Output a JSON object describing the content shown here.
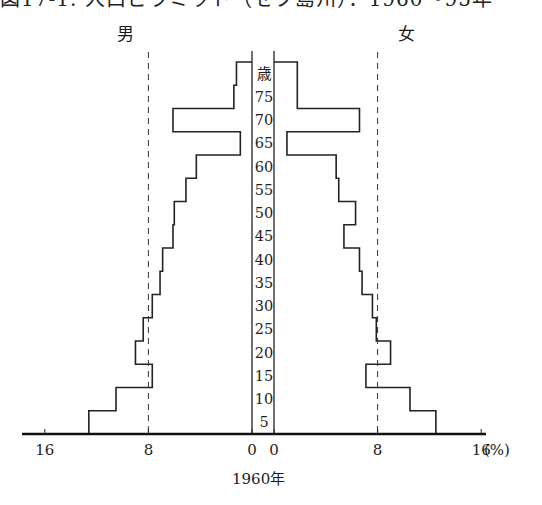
{
  "header": {
    "title": "図17-1. 人口ピラミッド（セブ島州）：1960～95年"
  },
  "labels": {
    "male": "男",
    "female": "女",
    "age_unit": "歳",
    "year": "1960年",
    "percent_unit": "(%)"
  },
  "chart_data": {
    "type": "bar",
    "subtype": "population-pyramid",
    "xlabel": "(%)",
    "ylabel": "歳",
    "categories": [
      "0-4",
      "5-9",
      "10-14",
      "15-19",
      "20-24",
      "25-29",
      "30-34",
      "35-39",
      "40-44",
      "45-49",
      "50-54",
      "55-59",
      "60-64",
      "65-69",
      "70-74",
      "75+"
    ],
    "age_tick_labels": [
      "5",
      "10",
      "15",
      "20",
      "25",
      "30",
      "35",
      "40",
      "45",
      "50",
      "55",
      "60",
      "65",
      "70",
      "75",
      "歳"
    ],
    "series": [
      {
        "name": "男",
        "side": "left",
        "values": [
          12.6,
          10.5,
          7.7,
          9.0,
          8.4,
          7.7,
          7.1,
          6.9,
          6.1,
          6.0,
          5.1,
          4.3,
          0.9,
          6.1,
          1.4,
          1.2
        ]
      },
      {
        "name": "女",
        "side": "right",
        "values": [
          12.5,
          10.5,
          7.1,
          9.0,
          7.9,
          7.6,
          6.8,
          6.6,
          5.4,
          6.3,
          5.0,
          4.8,
          1.0,
          6.6,
          1.8,
          1.8
        ]
      }
    ],
    "x_ticks_left": [
      "16",
      "8",
      "0"
    ],
    "x_ticks_right": [
      "0",
      "8",
      "16"
    ],
    "xlim": [
      0,
      16
    ],
    "reference_lines": [
      {
        "value": 8,
        "style": "dashed",
        "sides": [
          "left",
          "right"
        ]
      }
    ],
    "grid": false,
    "legend": "none"
  }
}
